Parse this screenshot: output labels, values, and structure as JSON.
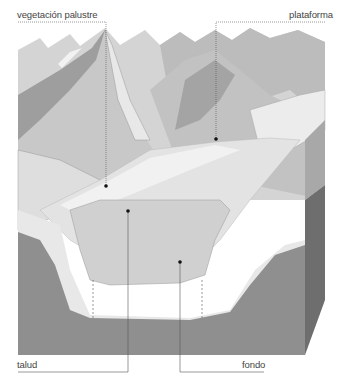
{
  "diagram": {
    "labels": [
      {
        "id": "vegetacion",
        "text": "vegetación palustre",
        "dot": [
          104,
          186
        ]
      },
      {
        "id": "plataforma",
        "text": "plataforma",
        "dot": [
          215,
          139
        ]
      },
      {
        "id": "talud",
        "text": "talud",
        "dot": [
          128,
          211
        ]
      },
      {
        "id": "fondo",
        "text": "fondo",
        "dot": [
          180,
          262
        ]
      }
    ],
    "colors": {
      "sky": "#ffffff",
      "mountain_light": "#d9d9d9",
      "mountain_mid": "#bdbdbd",
      "mountain_dark": "#9e9e9e",
      "snow": "#eeeeee",
      "water": "#dcdcdc",
      "sediment": "#e6e6e6",
      "bedrock_front": "#8f8f8f",
      "bedrock_side": "#6e6e6e",
      "leader_line": "#555555"
    }
  }
}
